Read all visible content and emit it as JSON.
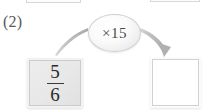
{
  "problem": {
    "number_label": "(2)",
    "type": "fraction-multiplication-flow"
  },
  "operator": {
    "label": "×15",
    "symbol": "×",
    "factor": "15",
    "shape": "oval"
  },
  "input_box": {
    "value": "5/6",
    "numerator": "5",
    "denominator": "6",
    "filled": "true"
  },
  "output_box": {
    "value": "",
    "placeholder": "",
    "filled": "false"
  },
  "arrow": {
    "name": "curved-arrow",
    "direction": "left-to-right-down",
    "color": "#b5b5b5"
  },
  "previous_row": {
    "left_box_label": "",
    "right_box_label": ""
  },
  "colors": {
    "page_background": "#ffffff",
    "box_fill_input": "#e9e9e9",
    "box_fill_output": "#ffffff",
    "box_border": "#cccccc",
    "text": "#2b2b2b",
    "muted_text": "#58585a",
    "arrow": "#b5b5b5"
  }
}
